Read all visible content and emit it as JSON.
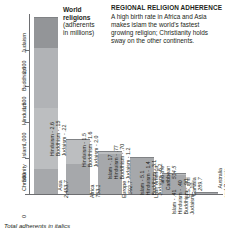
{
  "chart_title": {
    "line1": "World",
    "line2": "religions",
    "line3": "(adherents",
    "line4": "in millions)"
  },
  "side_panel": {
    "heading": "REGIONAL RELIGION ADHERENCE",
    "body": "A high birth rate in Africa and Asia makes islam the world's fastest growing religion; Christianity holds sway on the other continents."
  },
  "footnote": "Total adherents in italics",
  "colors": {
    "christianity": "#a6a8ab",
    "islam": "#bcbec0",
    "hinduism": "#b1b3b6",
    "buddhism": "#939598",
    "judaism": "#808285",
    "axis": "#6d6e71",
    "text": "#231f20"
  },
  "chart_data": {
    "type": "bar",
    "title": "World religions (adherents in millions)",
    "xlabel": "",
    "ylabel": "",
    "ylim": [
      0,
      2500
    ],
    "yticks": [
      0,
      500,
      1000,
      1500,
      2000
    ],
    "ytick_labels": [
      "0",
      "500",
      "1,000",
      "1,500",
      "2,000"
    ],
    "grid": false,
    "legend": "axis-labels",
    "religion_axis_labels": [
      "Christianity",
      "Islam",
      "Hinduism",
      "Buddhism",
      "Judaism"
    ],
    "categories": [
      "Asia",
      "Africa",
      "Europe",
      "Latin America and the Caribbean",
      "U.S. and Canada",
      "Australia and Oceania"
    ],
    "category_lines": [
      [
        "Asia"
      ],
      [
        "Africa"
      ],
      [
        "Europe"
      ],
      [
        "Latin America",
        "and the",
        "Caribbean"
      ],
      [
        "U.S. and",
        "Canada"
      ],
      [
        "Australia",
        "and Oceania"
      ]
    ],
    "totals": [
      "2,453.7",
      "753.1",
      "592.7",
      "514.5",
      "289.7",
      "27.6"
    ],
    "total_values": [
      2453.7,
      753.1,
      592.7,
      514.5,
      289.7,
      27.6
    ],
    "series": [
      {
        "name": "Christianity",
        "values": [
          350.4,
          411.1,
          553.7,
          511.0,
          276.0,
          25.8
        ]
      },
      {
        "name": "Islam",
        "values": [
          841.0,
          341.7,
          33.9,
          0.17,
          5.1,
          0.41
        ]
      },
      {
        "name": "Hinduism",
        "values": [
          834.9,
          2.6,
          1.5,
          0.77,
          1.4,
          0.4
        ]
      },
      {
        "name": "Buddhism",
        "values": [
          421.9,
          0.15,
          1.6,
          0.7,
          3.1,
          0.9
        ]
      },
      {
        "name": "Judaism",
        "values": [
          5.5,
          0.22,
          2.0,
          1.2,
          6.2,
          0.1
        ]
      }
    ],
    "annotations": [
      [],
      [
        "Hinduism - 2.6",
        "Buddhism - .15",
        "Judaism - .22"
      ],
      [
        "Hinduism - 1.5",
        "Buddhism - 1.6",
        "Judaism - 2.0"
      ],
      [
        "Islam - .17",
        "Hinduism - .77",
        "Buddhism - .70",
        "Judaism - 1.2"
      ],
      [
        "Islam - 5.1",
        "Hinduism - 1.4",
        "Buddhism - 3.1",
        "Judaism - 6.2"
      ],
      [
        "Islam - .41",
        "Hinduism - .40",
        "Buddhism - .90",
        "Judaism - .10"
      ]
    ]
  }
}
